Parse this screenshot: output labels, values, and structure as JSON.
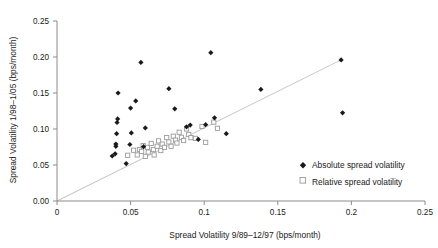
{
  "chart_data": {
    "type": "scatter",
    "title": "",
    "xlabel": "Spread Volatility 9/89–12/97 (bps/month)",
    "ylabel": "Spread Volatility 1/98–1/05 (bps/month)",
    "xlim": [
      0,
      0.25
    ],
    "ylim": [
      0,
      0.25
    ],
    "xticks": [
      0,
      0.05,
      0.1,
      0.15,
      0.2,
      0.25
    ],
    "yticks": [
      0,
      0.05,
      0.1,
      0.15,
      0.2,
      0.25
    ],
    "xtick_labels": [
      "0",
      "0.05",
      "0.1",
      "0.15",
      "0.2",
      "0.25"
    ],
    "ytick_labels": [
      "0.00",
      "0.05",
      "0.10",
      "0.15",
      "0.20",
      "0.25"
    ],
    "grid": false,
    "legend_position": "lower-right",
    "reference_line": {
      "label": "45-degree line",
      "x": [
        0.0,
        0.193
      ],
      "y": [
        0.0,
        0.196
      ],
      "color": "#c9c9c9"
    },
    "series": [
      {
        "name": "Absolute spread volatility",
        "marker": "filled-diamond",
        "color": "#1a1a1a",
        "points": [
          [
            0.0375,
            0.0625
          ],
          [
            0.0395,
            0.0655
          ],
          [
            0.04,
            0.076
          ],
          [
            0.04,
            0.079
          ],
          [
            0.0405,
            0.0935
          ],
          [
            0.0408,
            0.109
          ],
          [
            0.0412,
            0.114
          ],
          [
            0.0415,
            0.15
          ],
          [
            0.047,
            0.052
          ],
          [
            0.0495,
            0.0785
          ],
          [
            0.05,
            0.129
          ],
          [
            0.0505,
            0.0945
          ],
          [
            0.0535,
            0.139
          ],
          [
            0.057,
            0.1925
          ],
          [
            0.0588,
            0.0755
          ],
          [
            0.06,
            0.1015
          ],
          [
            0.076,
            0.156
          ],
          [
            0.08,
            0.128
          ],
          [
            0.088,
            0.103
          ],
          [
            0.0905,
            0.1055
          ],
          [
            0.096,
            0.0855
          ],
          [
            0.101,
            0.106
          ],
          [
            0.1045,
            0.206
          ],
          [
            0.107,
            0.1155
          ],
          [
            0.115,
            0.0935
          ],
          [
            0.1385,
            0.155
          ],
          [
            0.193,
            0.196
          ],
          [
            0.194,
            0.1225
          ]
        ]
      },
      {
        "name": "Relative spread volatility",
        "marker": "open-square",
        "color": "#9a9a9a",
        "points": [
          [
            0.048,
            0.0635
          ],
          [
            0.052,
            0.0705
          ],
          [
            0.0545,
            0.064
          ],
          [
            0.056,
            0.0715
          ],
          [
            0.0575,
            0.069
          ],
          [
            0.0585,
            0.077
          ],
          [
            0.06,
            0.062
          ],
          [
            0.0615,
            0.0745
          ],
          [
            0.062,
            0.068
          ],
          [
            0.064,
            0.08
          ],
          [
            0.0655,
            0.0715
          ],
          [
            0.066,
            0.064
          ],
          [
            0.068,
            0.076
          ],
          [
            0.069,
            0.0835
          ],
          [
            0.0705,
            0.07
          ],
          [
            0.0715,
            0.079
          ],
          [
            0.073,
            0.0745
          ],
          [
            0.0745,
            0.088
          ],
          [
            0.076,
            0.082
          ],
          [
            0.0775,
            0.076
          ],
          [
            0.079,
            0.09
          ],
          [
            0.0805,
            0.0845
          ],
          [
            0.0815,
            0.0805
          ],
          [
            0.083,
            0.0955
          ],
          [
            0.0845,
            0.0885
          ],
          [
            0.086,
            0.084
          ],
          [
            0.088,
            0.1
          ],
          [
            0.0895,
            0.0925
          ],
          [
            0.091,
            0.088
          ],
          [
            0.094,
            0.087
          ],
          [
            0.0985,
            0.1035
          ],
          [
            0.101,
            0.0815
          ],
          [
            0.1065,
            0.1095
          ],
          [
            0.109,
            0.101
          ]
        ]
      }
    ]
  },
  "legend": {
    "entries": [
      {
        "label": "Absolute spread volatility",
        "marker": "filled-diamond"
      },
      {
        "label": "Relative spread volatility",
        "marker": "open-square"
      }
    ]
  }
}
